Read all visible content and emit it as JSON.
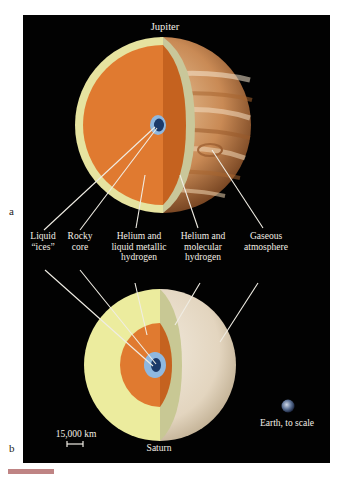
{
  "figure": {
    "panel_a": {
      "letter": "a",
      "planet_name": "Jupiter",
      "layers": [
        "Rocky core",
        "Liquid \"ices\"",
        "Helium and liquid metallic hydrogen",
        "Helium and molecular hydrogen",
        "Gaseous atmosphere"
      ]
    },
    "labels": {
      "liquid_ices": "Liquid\n“ices”",
      "rocky_core": "Rocky\ncore",
      "metallic": "Helium and\nliquid metallic\nhydrogen",
      "molecular": "Helium and\nmolecular\nhydrogen",
      "atmosphere": "Gaseous\natmosphere"
    },
    "panel_b": {
      "letter": "b",
      "planet_name": "Saturn",
      "scale_bar": "15,000 km",
      "earth_label": "Earth, to scale"
    },
    "colors": {
      "background": "#020202",
      "metallic_hydrogen": "#e07a30",
      "molecular_hydrogen": "#e6e3a0",
      "core": "#1c3a6a",
      "ices": "#8fb8e0",
      "jupiter_cloud": "#d9a876",
      "saturn_cloud": "#e8ddc8"
    }
  }
}
